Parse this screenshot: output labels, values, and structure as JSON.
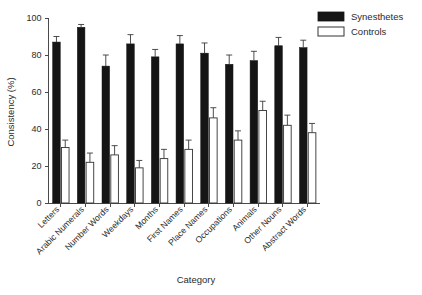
{
  "chart_data": {
    "type": "bar",
    "title": "",
    "xlabel": "Category",
    "ylabel": "Consistency (%)",
    "ylim": [
      0,
      100
    ],
    "yticks": [
      0,
      20,
      40,
      60,
      80,
      100
    ],
    "ytick_labels": [
      "0",
      "20",
      "40",
      "60",
      "80",
      "100"
    ],
    "grid": false,
    "legend_position": "top-right",
    "categories": [
      "Letters",
      "Arabic Numerals",
      "Number Words",
      "Weekdays",
      "Months",
      "First Names",
      "Place Names",
      "Occupations",
      "Animals",
      "Other Nouns",
      "Abstract Words"
    ],
    "series": [
      {
        "name": "Synesthetes",
        "color": "#151515",
        "fill": "solid",
        "values": [
          87,
          95,
          74,
          86,
          79,
          86,
          81,
          75,
          77,
          85,
          84
        ],
        "errors": [
          3,
          1.5,
          6,
          5,
          4,
          4.5,
          5.5,
          5,
          5,
          4.5,
          4
        ]
      },
      {
        "name": "Controls",
        "color": "#ffffff",
        "fill": "open",
        "values": [
          30,
          22,
          26,
          19,
          24,
          29,
          46,
          34,
          50,
          42,
          38
        ],
        "errors": [
          4,
          5,
          5,
          4,
          5,
          5,
          5.5,
          5,
          5,
          5.5,
          5
        ]
      }
    ]
  },
  "legend": {
    "items": [
      {
        "label": "Synesthetes",
        "swatch": "filled"
      },
      {
        "label": "Controls",
        "swatch": "open"
      }
    ]
  },
  "axes": {
    "y_title": "Consistency (%)",
    "x_title": "Category"
  }
}
